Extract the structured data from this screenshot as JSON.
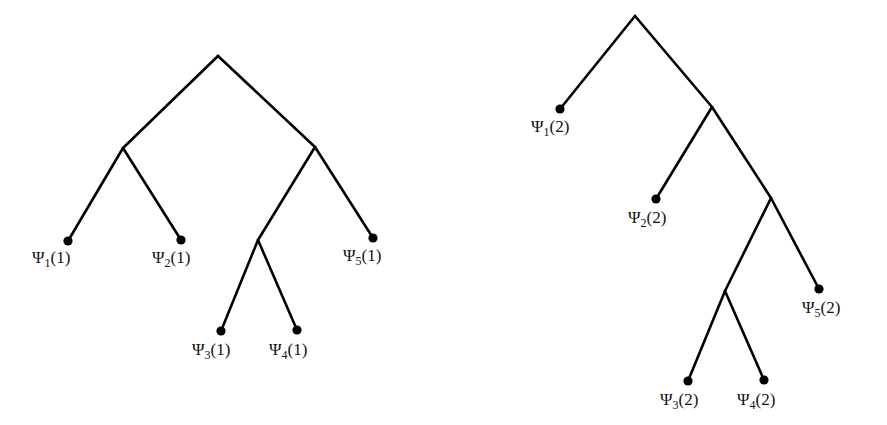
{
  "diagram": {
    "type": "binary-trees",
    "trees": [
      {
        "id": "tree-1",
        "nodes": {
          "root": [
            218,
            56
          ],
          "n_left": [
            123,
            148
          ],
          "n_right": [
            315,
            147
          ],
          "n_sub": [
            258,
            240
          ]
        },
        "edges": [
          [
            "root",
            "n_left"
          ],
          [
            "root",
            "n_right"
          ],
          [
            "n_left",
            "psi1"
          ],
          [
            "n_left",
            "psi2"
          ],
          [
            "n_right",
            "n_sub"
          ],
          [
            "n_right",
            "psi5"
          ],
          [
            "n_sub",
            "psi3"
          ],
          [
            "n_sub",
            "psi4"
          ]
        ],
        "leaves": [
          {
            "id": "psi1",
            "pos": [
              68,
              241
            ],
            "symbol": "Ψ",
            "index": "1",
            "arg": "(1)",
            "label_pos": [
              32,
              263
            ]
          },
          {
            "id": "psi2",
            "pos": [
              181,
              240
            ],
            "symbol": "Ψ",
            "index": "2",
            "arg": "(1)",
            "label_pos": [
              152,
              263
            ]
          },
          {
            "id": "psi3",
            "pos": [
              221,
              331
            ],
            "symbol": "Ψ",
            "index": "3",
            "arg": "(1)",
            "label_pos": [
              192,
              355
            ]
          },
          {
            "id": "psi4",
            "pos": [
              297,
              330
            ],
            "symbol": "Ψ",
            "index": "4",
            "arg": "(1)",
            "label_pos": [
              269,
              355
            ]
          },
          {
            "id": "psi5",
            "pos": [
              373,
              238
            ],
            "symbol": "Ψ",
            "index": "5",
            "arg": "(1)",
            "label_pos": [
              343,
              261
            ]
          }
        ]
      },
      {
        "id": "tree-2",
        "nodes": {
          "root": [
            635,
            16
          ],
          "nA": [
            712,
            107
          ],
          "nB": [
            771,
            198
          ],
          "nC": [
            725,
            291
          ]
        },
        "edges": [
          [
            "root",
            "psi1"
          ],
          [
            "root",
            "nA"
          ],
          [
            "nA",
            "psi2"
          ],
          [
            "nA",
            "nB"
          ],
          [
            "nB",
            "nC"
          ],
          [
            "nB",
            "psi5"
          ],
          [
            "nC",
            "psi3"
          ],
          [
            "nC",
            "psi4"
          ]
        ],
        "leaves": [
          {
            "id": "psi1",
            "pos": [
              560,
              109
            ],
            "symbol": "Ψ",
            "index": "1",
            "arg": "(2)",
            "label_pos": [
              531,
              132
            ]
          },
          {
            "id": "psi2",
            "pos": [
              656,
              199
            ],
            "symbol": "Ψ",
            "index": "2",
            "arg": "(2)",
            "label_pos": [
              628,
              223
            ]
          },
          {
            "id": "psi3",
            "pos": [
              688,
              381
            ],
            "symbol": "Ψ",
            "index": "3",
            "arg": "(2)",
            "label_pos": [
              660,
              405
            ]
          },
          {
            "id": "psi4",
            "pos": [
              764,
              380
            ],
            "symbol": "Ψ",
            "index": "4",
            "arg": "(2)",
            "label_pos": [
              737,
              405
            ]
          },
          {
            "id": "psi5",
            "pos": [
              819,
              289
            ],
            "symbol": "Ψ",
            "index": "5",
            "arg": "(2)",
            "label_pos": [
              802,
              313
            ]
          }
        ]
      }
    ],
    "colors": {
      "stroke": "#000000",
      "text": "#111111",
      "background": "#ffffff"
    }
  }
}
